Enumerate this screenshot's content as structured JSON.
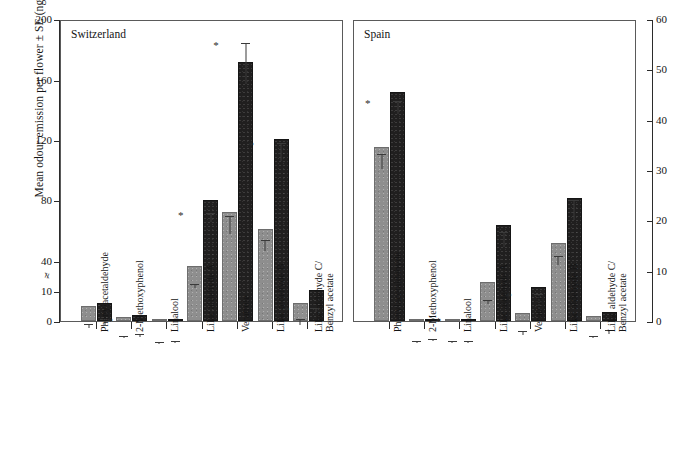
{
  "figure": {
    "ylabel_left": "Mean odour emission per flower ± SE (ng/h)",
    "panels": [
      {
        "title": "Switzerland"
      },
      {
        "title": "Spain"
      }
    ]
  },
  "axes": {
    "left": {
      "ticks": [
        "0",
        "10",
        "40",
        "80",
        "120",
        "160",
        "200"
      ],
      "break_marker": "≠",
      "min": 0,
      "max": 200
    },
    "right": {
      "ticks": [
        "0",
        "10",
        "20",
        "30",
        "40",
        "50",
        "60"
      ],
      "min": 0,
      "max": 60
    }
  },
  "categories": [
    {
      "line1": "Phenylacetaldehyde",
      "line2": ""
    },
    {
      "line1": "2-Methoxyphenol",
      "line2": ""
    },
    {
      "line1": "Linalool",
      "line2": ""
    },
    {
      "line1": "Lilac aldehyde A",
      "line2": ""
    },
    {
      "line1": "Veratrole",
      "line2": ""
    },
    {
      "line1": "Lilac aldehyde B",
      "line2": ""
    },
    {
      "line1": "Lilac aldehyde C/",
      "line2": "Benzyl acetate"
    }
  ],
  "chart_data": {
    "type": "bar",
    "title": "Mean odour emission per flower ± SE (ng/h)",
    "xlabel": "",
    "ylabel": "Mean odour emission per flower ± SE (ng/h)",
    "grid": false,
    "legend": null,
    "panels": [
      {
        "name": "Switzerland",
        "axis": "left",
        "ylim": [
          0,
          200
        ],
        "yticks": [
          0,
          10,
          40,
          80,
          120,
          160,
          200
        ],
        "axis_break_between": [
          10,
          40
        ],
        "categories": [
          "Phenylacetaldehyde",
          "2-Methoxyphenol",
          "Linalool",
          "Lilac aldehyde A",
          "Veratrole",
          "Lilac aldehyde B",
          "Lilac aldehyde C/Benzyl acetate"
        ],
        "series": [
          {
            "name": "grey",
            "values": [
              5.0,
              1.5,
              0.3,
              35.0,
              72.0,
              61.0,
              6.0
            ],
            "errors": [
              1.5,
              0.8,
              0.2,
              4.0,
              12.0,
              7.0,
              2.0
            ]
          },
          {
            "name": "black",
            "values": [
              6.0,
              2.0,
              0.5,
              80.0,
              172.0,
              121.0,
              11.0
            ],
            "errors": [
              2.0,
              1.0,
              0.3,
              6.0,
              27.0,
              12.0,
              4.0
            ]
          }
        ],
        "significance": [
          {
            "category": "2-Methoxyphenol",
            "marker": "*"
          },
          {
            "category": "Lilac aldehyde A",
            "marker": "*"
          },
          {
            "category": "Veratrole",
            "marker": "*"
          },
          {
            "category": "Lilac aldehyde B",
            "marker": "*"
          },
          {
            "category": "Lilac aldehyde C/Benzyl acetate",
            "marker": "*"
          }
        ]
      },
      {
        "name": "Spain",
        "axis": "right",
        "ylim": [
          0,
          60
        ],
        "yticks": [
          0,
          10,
          20,
          30,
          40,
          50,
          60
        ],
        "categories": [
          "Phenylacetaldehyde",
          "2-Methoxyphenol",
          "Linalool",
          "Lilac aldehyde A",
          "Veratrole",
          "Lilac aldehyde B",
          "Lilac aldehyde C/Benzyl acetate"
        ],
        "series": [
          {
            "name": "grey",
            "values": [
              34.5,
              0.3,
              0.3,
              7.8,
              1.6,
              15.5,
              1.0
            ],
            "errors": [
              3.0,
              0.2,
              0.2,
              0.8,
              0.8,
              1.8,
              0.4
            ]
          },
          {
            "name": "black",
            "values": [
              45.5,
              0.5,
              0.3,
              19.0,
              6.7,
              24.5,
              1.8
            ],
            "errors": [
              2.5,
              0.3,
              0.2,
              3.0,
              3.0,
              4.0,
              0.8
            ]
          }
        ],
        "significance": [
          {
            "category": "Phenylacetaldehyde",
            "marker": "*"
          },
          {
            "category": "Linalool",
            "marker": "*"
          },
          {
            "category": "Veratrole",
            "marker": "*"
          }
        ]
      }
    ]
  }
}
